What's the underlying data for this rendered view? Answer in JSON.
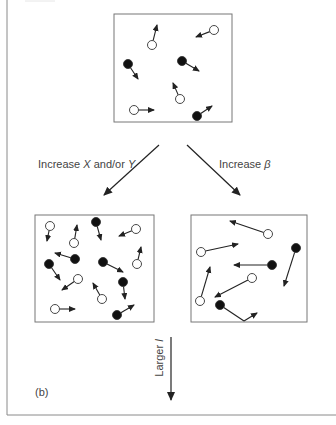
{
  "figure": {
    "top_label": "(a)",
    "panel_label": "(b)",
    "colors": {
      "ink": "#222222",
      "frame": "#888888",
      "box": "#777777",
      "text": "#444444"
    }
  },
  "transitions": {
    "left": {
      "prefix": "Increase ",
      "var1": "X",
      "mid": " and/or ",
      "var2": "Y"
    },
    "right": {
      "prefix": "Increase ",
      "var1": "β"
    },
    "down": {
      "prefix": "Larger ",
      "var1": "l"
    }
  },
  "boxes": {
    "initial": {
      "rect": [
        114,
        14,
        118,
        108
      ],
      "particles": [
        {
          "fill": "open",
          "x": 152,
          "y": 45,
          "dx": 5,
          "dy": -20
        },
        {
          "fill": "open",
          "x": 214,
          "y": 30,
          "dx": -18,
          "dy": 7
        },
        {
          "fill": "solid",
          "x": 128,
          "y": 64,
          "dx": 10,
          "dy": 15
        },
        {
          "fill": "solid",
          "x": 182,
          "y": 61,
          "dx": 17,
          "dy": 10
        },
        {
          "fill": "open",
          "x": 180,
          "y": 99,
          "dx": -7,
          "dy": -16
        },
        {
          "fill": "open",
          "x": 134,
          "y": 110,
          "dx": 20,
          "dy": 0
        },
        {
          "fill": "solid",
          "x": 197,
          "y": 116,
          "dx": 15,
          "dy": -10
        }
      ]
    },
    "more_particles": {
      "rect": [
        35,
        215,
        119,
        107
      ],
      "particles": [
        {
          "fill": "open",
          "x": 50,
          "y": 226,
          "dx": -3,
          "dy": 15
        },
        {
          "fill": "open",
          "x": 74,
          "y": 243,
          "dx": 3,
          "dy": -18
        },
        {
          "fill": "solid",
          "x": 96,
          "y": 222,
          "dx": 5,
          "dy": 18
        },
        {
          "fill": "open",
          "x": 136,
          "y": 229,
          "dx": -17,
          "dy": 7
        },
        {
          "fill": "solid",
          "x": 75,
          "y": 259,
          "dx": -20,
          "dy": -6
        },
        {
          "fill": "open",
          "x": 137,
          "y": 264,
          "dx": 4,
          "dy": -17
        },
        {
          "fill": "solid",
          "x": 49,
          "y": 264,
          "dx": 11,
          "dy": 16
        },
        {
          "fill": "solid",
          "x": 103,
          "y": 262,
          "dx": 20,
          "dy": 10
        },
        {
          "fill": "open",
          "x": 78,
          "y": 279,
          "dx": -16,
          "dy": 11
        },
        {
          "fill": "solid",
          "x": 123,
          "y": 282,
          "dx": 2,
          "dy": 17
        },
        {
          "fill": "open",
          "x": 102,
          "y": 299,
          "dx": -9,
          "dy": -16
        },
        {
          "fill": "open",
          "x": 55,
          "y": 309,
          "dx": 20,
          "dy": 0
        },
        {
          "fill": "solid",
          "x": 117,
          "y": 315,
          "dx": 17,
          "dy": -10
        }
      ]
    },
    "faster_particles": {
      "rect": [
        191,
        215,
        116,
        107
      ],
      "particles": [
        {
          "fill": "open",
          "x": 268,
          "y": 234,
          "dx": -38,
          "dy": -13
        },
        {
          "fill": "open",
          "x": 201,
          "y": 252,
          "dx": 37,
          "dy": -8
        },
        {
          "fill": "solid",
          "x": 272,
          "y": 265,
          "dx": -38,
          "dy": 0
        },
        {
          "fill": "solid",
          "x": 296,
          "y": 248,
          "dx": -12,
          "dy": 38
        },
        {
          "fill": "open",
          "x": 252,
          "y": 278,
          "dx": -37,
          "dy": 19
        },
        {
          "fill": "open",
          "x": 200,
          "y": 301,
          "dx": 10,
          "dy": -34
        },
        {
          "fill": "solid",
          "x": 220,
          "y": 305,
          "dx": 24,
          "dy": 16,
          "bounce": {
            "dx": 13,
            "dy": -8
          }
        }
      ]
    }
  }
}
